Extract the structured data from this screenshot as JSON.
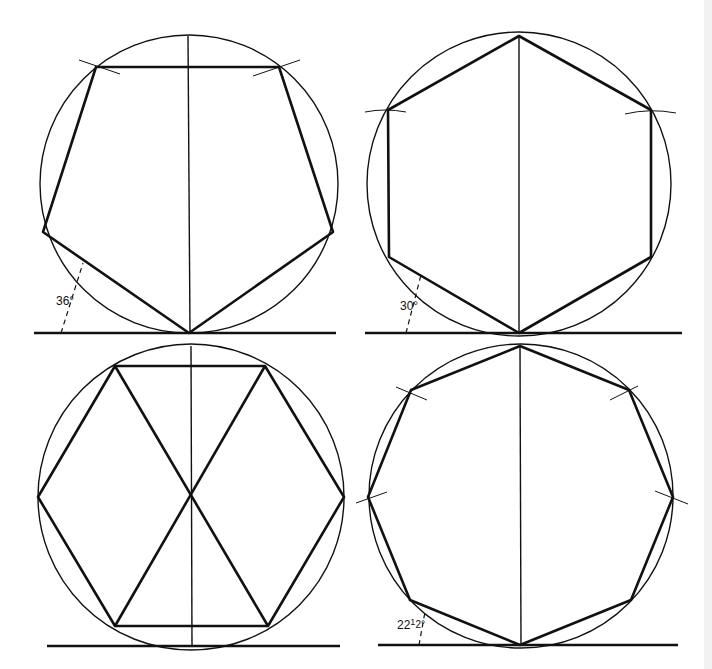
{
  "figures": [
    {
      "name": "pentagon",
      "sides": 5,
      "angle_label": "36°"
    },
    {
      "name": "hexagon-pointed",
      "sides": 6,
      "angle_label": "30°"
    },
    {
      "name": "hexagon-flat",
      "sides": 6,
      "angle_label": ""
    },
    {
      "name": "octagon",
      "sides": 8,
      "angle_label": "22½°",
      "angle_label_main": "22",
      "angle_label_frac": "1",
      "angle_label_den": "2°"
    }
  ],
  "colors": {
    "line": "#111111",
    "background": "#ffffff"
  }
}
